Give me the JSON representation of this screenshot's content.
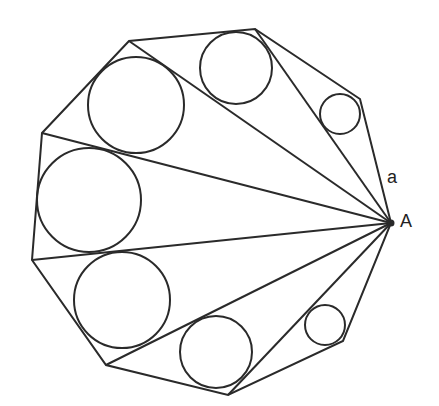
{
  "diagram": {
    "stroke_color": "#2a2a2a",
    "labels": {
      "vertex": "A",
      "side": "a"
    },
    "vertices": [
      [
        391,
        223
      ],
      [
        360,
        99
      ],
      [
        255,
        29
      ],
      [
        129,
        41
      ],
      [
        42,
        133
      ],
      [
        32,
        260
      ],
      [
        106,
        365
      ],
      [
        228,
        395
      ],
      [
        343,
        341
      ]
    ],
    "incircles": [
      {
        "cx": 340,
        "cy": 114,
        "r": 20
      },
      {
        "cx": 236,
        "cy": 68,
        "r": 36
      },
      {
        "cx": 136,
        "cy": 105,
        "r": 48
      },
      {
        "cx": 89,
        "cy": 200,
        "r": 52
      },
      {
        "cx": 122,
        "cy": 300,
        "r": 48
      },
      {
        "cx": 216,
        "cy": 352,
        "r": 36
      },
      {
        "cx": 325,
        "cy": 325,
        "r": 20
      }
    ]
  }
}
